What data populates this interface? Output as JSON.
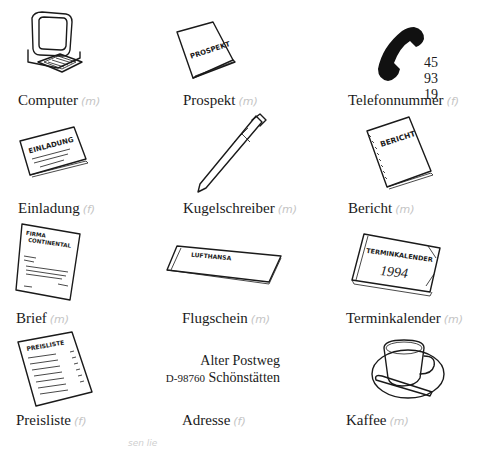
{
  "page": {
    "items": [
      {
        "word": "Computer",
        "gender_note": "(m)",
        "icon": "computer-icon"
      },
      {
        "word": "Prospekt",
        "gender_note": "(m)",
        "icon": "brochure-icon",
        "icon_text": "PROSPEKT"
      },
      {
        "word": "Telefonnummer",
        "gender_note": "(f)",
        "icon": "telephone-icon",
        "extra_text": "45 93 19"
      },
      {
        "word": "Einladung",
        "gender_note": "(f)",
        "icon": "invitation-card-icon",
        "icon_text": "EINLADUNG"
      },
      {
        "word": "Kugelschreiber",
        "gender_note": "(m)",
        "icon": "ballpoint-pen-icon"
      },
      {
        "word": "Bericht",
        "gender_note": "(m)",
        "icon": "report-notebook-icon",
        "icon_text": "BERICHT"
      },
      {
        "word": "Brief",
        "gender_note": "(m)",
        "icon": "letter-icon",
        "icon_text_1": "FIRMA",
        "icon_text_2": "CONTINENTAL"
      },
      {
        "word": "Flugschein",
        "gender_note": "(m)",
        "icon": "flight-ticket-icon",
        "icon_text": "LUFTHANSA"
      },
      {
        "word": "Terminkalender",
        "gender_note": "(m)",
        "icon": "appointment-calendar-icon",
        "icon_text_1": "TERMINKALENDER",
        "icon_text_2": "1994"
      },
      {
        "word": "Preisliste",
        "gender_note": "(f)",
        "icon": "price-list-icon",
        "icon_text": "PREISLISTE"
      },
      {
        "word": "Adresse",
        "gender_note": "(f)",
        "icon": "address-text",
        "address_line_1": "Alter Postweg",
        "address_zip": "D-98760",
        "address_city": "Schönstätten"
      },
      {
        "word": "Kaffee",
        "gender_note": "(m)",
        "icon": "coffee-cup-icon"
      }
    ],
    "bottom_scribble": "sen   lie"
  }
}
